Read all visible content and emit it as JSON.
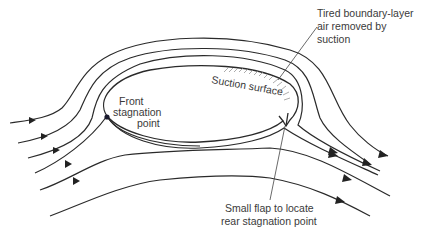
{
  "diagram": {
    "type": "flow-around-body",
    "labels": {
      "suction_removed_line1": "Tired boundary-layer",
      "suction_removed_line2": "air removed by",
      "suction_removed_line3": "suction",
      "suction_surface": "Suction surface",
      "front_stagnation_line1": "Front",
      "front_stagnation_line2": "stagnation",
      "front_stagnation_line3": "point",
      "flap_line1": "Small flap to locate",
      "flap_line2": "rear stagnation point"
    },
    "colors": {
      "line": "#2a2a2a",
      "text": "#3a3a3a",
      "hatch": "#888888",
      "background": "#ffffff"
    },
    "elements": {
      "streamlines_count": 7,
      "stagnation_point_marker": "filled-dot",
      "flow_direction": "left-to-right"
    }
  }
}
